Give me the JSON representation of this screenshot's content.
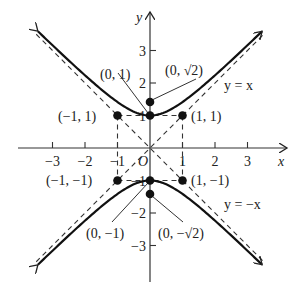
{
  "diagram": {
    "axes": {
      "x_label": "x",
      "y_label": "y",
      "origin_label": "O",
      "x_ticks": [
        {
          "value": -3,
          "label": "−3"
        },
        {
          "value": -2,
          "label": "−2"
        },
        {
          "value": -1,
          "label": "−1"
        },
        {
          "value": 1,
          "label": "1"
        },
        {
          "value": 2,
          "label": "2"
        },
        {
          "value": 3,
          "label": "3"
        }
      ],
      "y_ticks": [
        {
          "value": 3,
          "label": "3"
        },
        {
          "value": 2,
          "label": "2"
        },
        {
          "value": 1,
          "label": "1"
        },
        {
          "value": -1,
          "label": "−1"
        },
        {
          "value": -2,
          "label": "−2"
        },
        {
          "value": -3,
          "label": "−3"
        }
      ],
      "x_range": [
        -3.8,
        4.2
      ],
      "y_range": [
        -4.1,
        4.1
      ]
    },
    "curves": [
      {
        "name": "upper-branch",
        "equation": "y = sqrt(1 + x^2)",
        "style": "solid"
      },
      {
        "name": "lower-branch",
        "equation": "y = -sqrt(1 + x^2)",
        "style": "solid"
      }
    ],
    "asymptotes": [
      {
        "name": "asymptote-y-equals-x",
        "label": "y = x",
        "slope": 1
      },
      {
        "name": "asymptote-y-equals-neg-x",
        "label": "y = −x",
        "slope": -1
      }
    ],
    "points": [
      {
        "name": "point-0-1",
        "x": 0,
        "y": 1,
        "label": "(0, 1)"
      },
      {
        "name": "point-0-sqrt2",
        "x": 0,
        "y": 1.4142,
        "label": "(0, √2)"
      },
      {
        "name": "point-neg1-1",
        "x": -1,
        "y": 1,
        "label": "(−1, 1)"
      },
      {
        "name": "point-1-1",
        "x": 1,
        "y": 1,
        "label": "(1, 1)"
      },
      {
        "name": "point-neg1-neg1",
        "x": -1,
        "y": -1,
        "label": "(−1, −1)"
      },
      {
        "name": "point-1-neg1",
        "x": 1,
        "y": -1,
        "label": "(1, −1)"
      },
      {
        "name": "point-0-neg1",
        "x": 0,
        "y": -1,
        "label": "(0, −1)"
      },
      {
        "name": "point-0-neg-sqrt2",
        "x": 0,
        "y": -1.4142,
        "label": "(0, −√2)"
      }
    ],
    "box": {
      "x_min": -1,
      "x_max": 1,
      "y_min": -1,
      "y_max": 1,
      "style": "dashed"
    }
  }
}
